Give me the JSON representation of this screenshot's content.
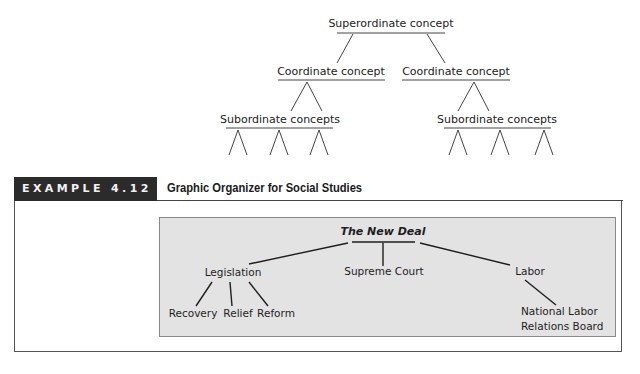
{
  "hierarchy_diagram": {
    "superordinate": "Superordinate concept",
    "coordinates": [
      "Coordinate concept",
      "Coordinate concept"
    ],
    "subordinates": [
      "Subordinate concepts",
      "Subordinate concepts"
    ]
  },
  "example": {
    "label": "EXAMPLE 4.12",
    "title": "Graphic Organizer for Social Studies"
  },
  "organizer": {
    "root": "The New Deal",
    "branches": [
      {
        "label": "Legislation",
        "children": [
          "Recovery",
          "Relief",
          "Reform"
        ]
      },
      {
        "label": "Supreme Court",
        "children": []
      },
      {
        "label": "Labor",
        "children": [
          "National Labor",
          "Relations Board"
        ]
      }
    ]
  },
  "colors": {
    "label_bg": "#2b2b2b",
    "label_text": "#f2f2f2",
    "organizer_bg": "#e3e3e3",
    "line": "#333333"
  }
}
